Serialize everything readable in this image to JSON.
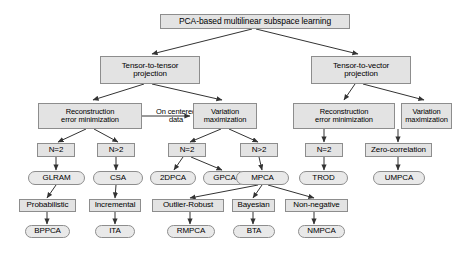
{
  "figure": {
    "type": "tree-diagram",
    "root": "PCA-based multilinear subspace learning",
    "background_color": "#ffffff",
    "node_fill": "#e3e3e3",
    "node_border": "#8d8d8d",
    "edge_color": "#333333"
  },
  "nodes": {
    "root": "PCA-based multilinear subspace learning",
    "ttp": "Tensor-to-tensor projection",
    "ttp_line1": "Tensor-to-tensor",
    "ttp_line2": "projection",
    "tvp_line1": "Tensor-to-vector",
    "tvp_line2": "projection",
    "recon1_line1": "Reconstruction",
    "recon1_line2": "error minimization",
    "oncentered_line1": "On centered",
    "oncentered_line2": "data",
    "var1_line1": "Variation",
    "var1_line2": "maximization",
    "recon2_line1": "Reconstruction",
    "recon2_line2": "error minimization",
    "var2_line1": "Variation",
    "var2_line2": "maximization",
    "n_eq_2_a": "N=2",
    "n_gt_2_a": "N>2",
    "n_eq_2_b": "N=2",
    "n_gt_2_b": "N>2",
    "n_eq_2_c": "N=2",
    "zero_correlation": "Zero-correlation",
    "glram": "GLRAM",
    "csa": "CSA",
    "twodpca": "2DPCA",
    "gpca": "GPCA",
    "mpca": "MPCA",
    "trod": "TROD",
    "umpca": "UMPCA",
    "probabilistic": "Probabilistic",
    "incremental": "Incremental",
    "outlier_robust": "Outlier-Robust",
    "bayesian": "Bayesian",
    "non_negative": "Non-negative",
    "bppca": "BPPCA",
    "ita": "ITA",
    "rmpca": "RMPCA",
    "bta": "BTA",
    "nmpca": "NMPCA"
  }
}
